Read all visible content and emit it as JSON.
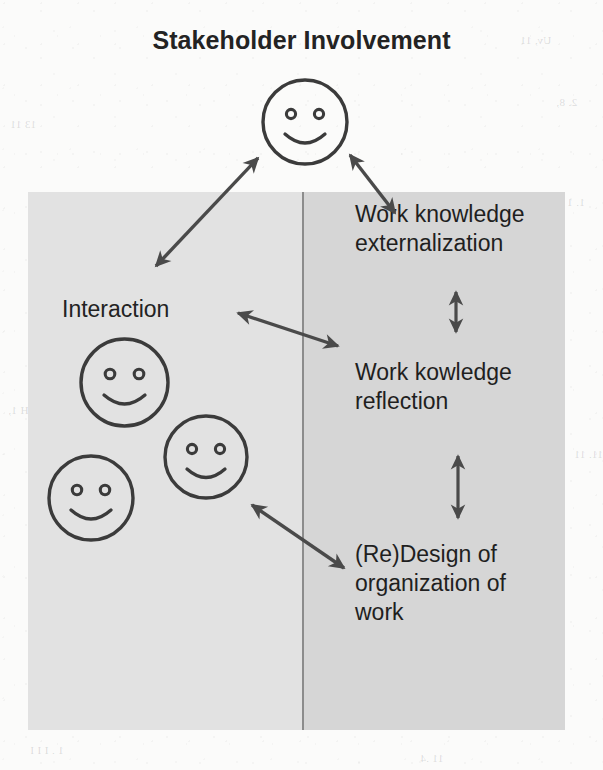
{
  "figure": {
    "title": "Stakeholder Involvement",
    "type": "conceptual-diagram",
    "colors": {
      "panel_left": "#e2e2e2",
      "panel_right": "#d6d6d6",
      "divider": "#8c8c8c",
      "ink": "#3a3a3a",
      "text": "#232323",
      "background": "#fbfbfa"
    }
  },
  "left_column": {
    "label": "Interaction",
    "actors": [
      {
        "name": "smiley-face-1",
        "expression": "smiling"
      },
      {
        "name": "smiley-face-2",
        "expression": "smiling"
      },
      {
        "name": "smiley-face-3",
        "expression": "smiling"
      }
    ]
  },
  "right_column": {
    "steps": [
      {
        "line1": "Work knowledge",
        "line2": "externalization"
      },
      {
        "line1": "Work kowledge",
        "line2": "reflection"
      },
      {
        "line1": "(Re)Design of",
        "line2": "organization of",
        "line3": "work"
      }
    ]
  },
  "top_actor": {
    "name": "stakeholder-smiley-face",
    "expression": "smiling"
  },
  "connectors": [
    {
      "name": "stakeholder-to-interaction",
      "style": "double-headed",
      "direction": "diagonal-down-left"
    },
    {
      "name": "stakeholder-to-externalization",
      "style": "double-headed",
      "direction": "diagonal-down-right"
    },
    {
      "name": "interaction-to-externalization",
      "style": "double-headed",
      "direction": "diagonal-right-down"
    },
    {
      "name": "externalization-to-reflection",
      "style": "double-headed",
      "direction": "vertical"
    },
    {
      "name": "reflection-to-redesign",
      "style": "double-headed",
      "direction": "vertical"
    },
    {
      "name": "interaction-to-redesign",
      "style": "double-headed",
      "direction": "diagonal-right-down"
    }
  ],
  "ghost_marks": [
    "Uv, 11",
    "2. 8,",
    "13 11",
    "1.  1 A",
    "H 1,",
    "11. 11",
    "1 . I I I",
    "11 .4"
  ]
}
